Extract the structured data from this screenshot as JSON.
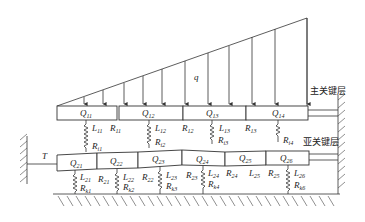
{
  "diagram": {
    "load_label": "q",
    "tension_label": "T",
    "main_key_layer_label": "主关键层",
    "sub_key_layer_label": "亚关键层",
    "upper_blocks": [
      {
        "label": "Q",
        "sub": "11"
      },
      {
        "label": "Q",
        "sub": "12"
      },
      {
        "label": "Q",
        "sub": "13"
      },
      {
        "label": "Q",
        "sub": "14"
      }
    ],
    "upper_labels": [
      {
        "L": "L",
        "Lsub": "11",
        "R": "R",
        "Rsub": "11",
        "Ri": "R",
        "Risub": "i1"
      },
      {
        "L": "L",
        "Lsub": "12",
        "R": "R",
        "Rsub": "12",
        "Ri": "R",
        "Risub": "i2"
      },
      {
        "L": "L",
        "Lsub": "13",
        "R": "R",
        "Rsub": "13",
        "Ri": "R",
        "Risub": "i3"
      },
      {
        "Ri": "R",
        "Risub": "i4"
      }
    ],
    "lower_blocks": [
      {
        "label": "Q",
        "sub": "21"
      },
      {
        "label": "Q",
        "sub": "22"
      },
      {
        "label": "Q",
        "sub": "23"
      },
      {
        "label": "Q",
        "sub": "24"
      },
      {
        "label": "Q",
        "sub": "25"
      },
      {
        "label": "Q",
        "sub": "26"
      }
    ],
    "lower_labels": [
      {
        "L": "L",
        "Lsub": "21",
        "R": "R",
        "Rsub": "21",
        "Rk": "R",
        "Rksub": "k1"
      },
      {
        "L": "L",
        "Lsub": "22",
        "R": "R",
        "Rsub": "22",
        "Rk": "R",
        "Rksub": "k2"
      },
      {
        "L": "L",
        "Lsub": "23",
        "R": "R",
        "Rsub": "23",
        "Rk": "R",
        "Rksub": "k3"
      },
      {
        "L": "L",
        "Lsub": "24",
        "R": "R",
        "Rsub": "24",
        "Rk": "R",
        "Rksub": "k4"
      },
      {
        "L": "L",
        "Lsub": "25",
        "R": "R",
        "Rsub": "25"
      },
      {
        "L": "L",
        "Lsub": "26",
        "Rk": "R",
        "Rksub": "k6"
      }
    ]
  }
}
